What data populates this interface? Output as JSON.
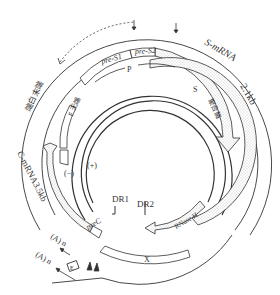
{
  "diagram": {
    "labels": {
      "s_mrna": "S-mRNA",
      "s_mrna_size": "2.1kb",
      "c_mrna": "C-mRNA3.5kb",
      "pre_s1": "pre-S1",
      "pre_s2": "pre-S2",
      "p": "P",
      "s_region": "S",
      "polymerase": "聚合酶",
      "spacer": "F 无端",
      "terminal_protein": "端白末端",
      "minus_strand": "(−)",
      "plus_strand": "(+)",
      "dr1": "DR1",
      "dr2": "DR2",
      "prec": "preC",
      "rnase_h": "RNase H",
      "x": "X",
      "poly_a_1": "(A) n",
      "poly_a_2": "(A) n",
      "enhancer": "E"
    },
    "colors": {
      "line": "#333333",
      "stipple": "#cfcfcf",
      "background": "#ffffff"
    }
  }
}
